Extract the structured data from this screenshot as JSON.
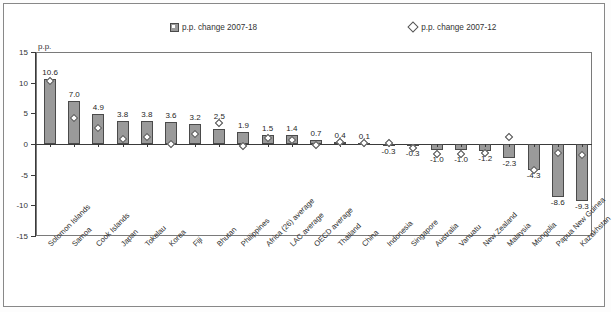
{
  "chart_data": {
    "type": "bar",
    "title": "",
    "xlabel": "",
    "ylabel": "p.p.",
    "unit_label": "p.p.",
    "ylim": [
      -15,
      15
    ],
    "yticks": [
      15,
      10,
      5,
      0,
      -5,
      -10,
      -15
    ],
    "grid": false,
    "legend_position": "top",
    "legend": [
      {
        "label": "p.p. change 2007-18",
        "marker": "filled-square",
        "color": "#9a9a9a"
      },
      {
        "label": "p.p. change 2007-12",
        "marker": "open-diamond",
        "color": "#ffffff"
      }
    ],
    "categories": [
      "Solomon Islands",
      "Samoa",
      "Cook Islands",
      "Japan",
      "Tokelau",
      "Korea",
      "Fiji",
      "Bhutan",
      "Philippines",
      "Africa (26) average",
      "LAC average",
      "OECD average",
      "Thailand",
      "China",
      "Indonesia",
      "Singapore",
      "Australia",
      "Vanuatu",
      "New Zealand",
      "Malaysia",
      "Mongolia",
      "Papua New Guinea",
      "Kazakhstan"
    ],
    "series": [
      {
        "name": "p.p. change 2007-18",
        "type": "bar",
        "values": [
          10.6,
          7.0,
          4.9,
          3.8,
          3.8,
          3.6,
          3.2,
          2.5,
          1.9,
          1.5,
          1.4,
          0.7,
          0.4,
          0.1,
          -0.3,
          -0.3,
          -1.0,
          -1.0,
          -1.2,
          -2.3,
          -4.3,
          -8.6,
          -9.3
        ],
        "labels": [
          "10.6",
          "7.0",
          "4.9",
          "3.8",
          "3.8",
          "3.6",
          "3.2",
          "2.5",
          "1.9",
          "1.5",
          "1.4",
          "0.7",
          "0.4",
          "0.1",
          "-0.3",
          "-0.3",
          "-1.0",
          "-1.0",
          "-1.2",
          "-2.3",
          "-4.3",
          "-8.6",
          "-9.3"
        ]
      },
      {
        "name": "p.p. change 2007-12",
        "type": "scatter",
        "values": [
          10.2,
          4.3,
          2.6,
          0.8,
          1.1,
          0.0,
          1.7,
          3.4,
          -0.4,
          0.9,
          0.6,
          -0.2,
          0.3,
          0.2,
          0.1,
          -0.6,
          -1.6,
          -1.6,
          -1.5,
          1.2,
          -4.3,
          -1.5,
          -1.8
        ]
      }
    ]
  }
}
